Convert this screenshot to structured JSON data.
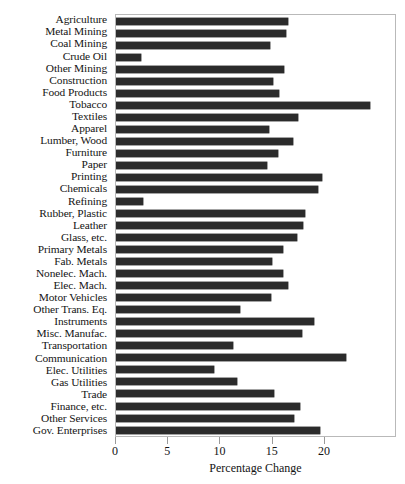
{
  "chart_data": {
    "type": "bar",
    "orientation": "horizontal",
    "title": "",
    "xlabel": "Percentage Change",
    "ylabel": "",
    "xlim": [
      0,
      26.9
    ],
    "xticks": [
      0,
      5,
      10,
      15,
      20
    ],
    "xticklabels": [
      "0",
      "5",
      "10",
      "15",
      "20"
    ],
    "grid": false,
    "legend": null,
    "bar_color": "#2b2b2b",
    "categories": [
      "Agriculture",
      "Metal Mining",
      "Coal Mining",
      "Crude Oil",
      "Other Mining",
      "Construction",
      "Food Products",
      "Tobacco",
      "Textiles",
      "Apparel",
      "Lumber, Wood",
      "Furniture",
      "Paper",
      "Printing",
      "Chemicals",
      "Refining",
      "Rubber, Plastic",
      "Leather",
      "Glass, etc.",
      "Primary Metals",
      "Fab. Metals",
      "Nonelec. Mach.",
      "Elec. Mach.",
      "Motor Vehicles",
      "Other Trans. Eq.",
      "Instruments",
      "Misc. Manufac.",
      "Transportation",
      "Communication",
      "Elec. Utilities",
      "Gas Utilities",
      "Trade",
      "Finance, etc.",
      "Other Services",
      "Gov. Enterprises"
    ],
    "values": [
      16.5,
      16.3,
      14.7,
      2.4,
      16.1,
      15.0,
      15.6,
      24.3,
      17.4,
      14.6,
      16.9,
      15.5,
      14.5,
      19.7,
      19.3,
      2.6,
      18.1,
      17.9,
      17.3,
      16.0,
      14.9,
      16.0,
      16.5,
      14.8,
      11.9,
      19.0,
      17.8,
      11.2,
      22.0,
      9.4,
      11.6,
      15.1,
      17.6,
      17.0,
      19.5
    ]
  }
}
